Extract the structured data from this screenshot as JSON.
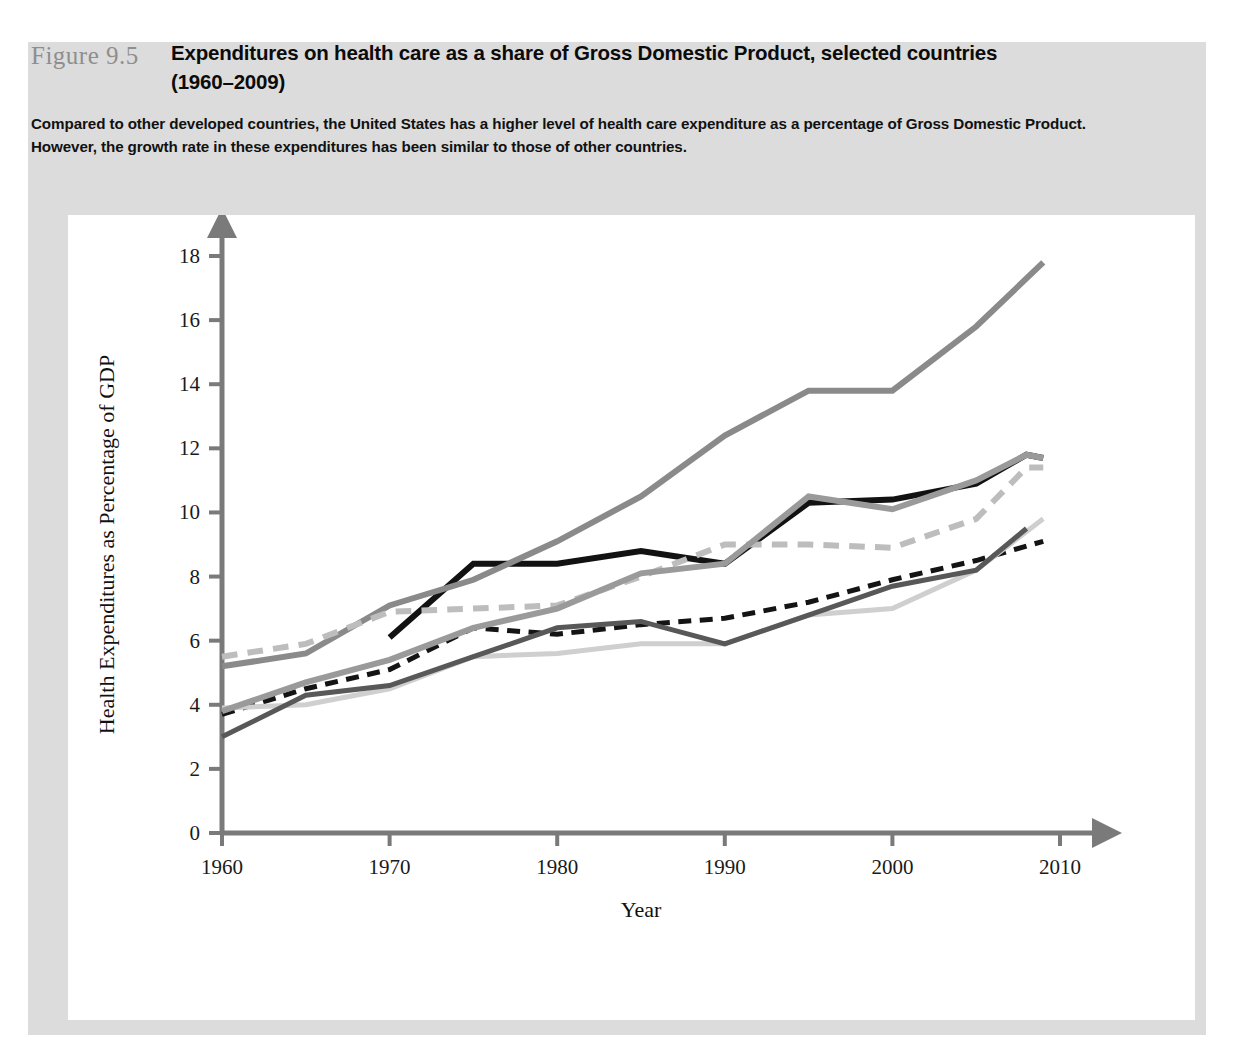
{
  "figure": {
    "number": "Figure 9.5",
    "title_line1": "Expenditures on health care as a share of Gross Domestic Product, selected countries",
    "title_line2": "(1960–2009)",
    "caption_line1": "Compared to other developed countries, the United States has a higher level of health care expenditure as a percentage of Gross Domestic Product.",
    "caption_line2": "However, the growth rate in these expenditures has been similar to those of other countries."
  },
  "colors": {
    "frame_background": "#dcdcdc",
    "panel_background": "#ffffff",
    "axis": "#7a7a7a",
    "text": "#111111",
    "figure_number": "#8e8e8e",
    "australia": "#141414",
    "united_kingdom": "#cfcfcf",
    "germany": "#121212",
    "united_states": "#8a8a8a",
    "japan": "#585858",
    "canada": "#bdbdbd",
    "france": "#9a9a9a"
  },
  "legend": {
    "rows": [
      [
        {
          "label": "Australia",
          "key": "australia",
          "color": "#141414",
          "dashed": true,
          "width": 7
        },
        {
          "label": "United Kingdom",
          "key": "united_kingdom",
          "color": "#cfcfcf",
          "dashed": false,
          "width": 5
        },
        {
          "label": "Germany",
          "key": "germany",
          "color": "#121212",
          "dashed": false,
          "width": 7
        },
        {
          "label": "United States",
          "key": "united_states",
          "color": "#8a8a8a",
          "dashed": false,
          "width": 7
        }
      ],
      [
        {
          "label": "Japan",
          "key": "japan",
          "color": "#585858",
          "dashed": false,
          "width": 7
        },
        {
          "label": "Canada",
          "key": "canada",
          "color": "#bdbdbd",
          "dashed": true,
          "width": 7
        },
        {
          "label": "France",
          "key": "france",
          "color": "#9a9a9a",
          "dashed": false,
          "width": 7
        }
      ]
    ]
  },
  "chart_data": {
    "type": "line",
    "title": "Expenditures on health care as a share of Gross Domestic Product, selected countries (1960–2009)",
    "xlabel": "Year",
    "ylabel": "Health Expenditures as Percentage of GDP",
    "xlim": [
      1960,
      2010
    ],
    "ylim": [
      0,
      18
    ],
    "xticks": [
      1960,
      1970,
      1980,
      1990,
      2000,
      2010
    ],
    "yticks": [
      0,
      2,
      4,
      6,
      8,
      10,
      12,
      14,
      16,
      18
    ],
    "grid": false,
    "legend_position": "bottom",
    "series": [
      {
        "name": "Australia",
        "color": "#141414",
        "style": "dashed",
        "width": 5,
        "x": [
          1960,
          1965,
          1970,
          1975,
          1980,
          1985,
          1990,
          1995,
          2000,
          2005,
          2009
        ],
        "values": [
          3.7,
          4.5,
          5.1,
          6.4,
          6.2,
          6.5,
          6.7,
          7.2,
          7.9,
          8.5,
          9.1
        ]
      },
      {
        "name": "United Kingdom",
        "color": "#cfcfcf",
        "style": "solid",
        "width": 5,
        "x": [
          1960,
          1965,
          1970,
          1975,
          1980,
          1985,
          1990,
          1995,
          2000,
          2005,
          2009
        ],
        "values": [
          3.9,
          4.0,
          4.5,
          5.5,
          5.6,
          5.9,
          5.9,
          6.8,
          7.0,
          8.2,
          9.8
        ]
      },
      {
        "name": "Germany",
        "color": "#121212",
        "style": "solid",
        "width": 6,
        "x": [
          1970,
          1975,
          1980,
          1985,
          1990,
          1995,
          2000,
          2005,
          2008,
          2009
        ],
        "values": [
          6.1,
          8.4,
          8.4,
          8.8,
          8.4,
          10.3,
          10.4,
          10.9,
          11.8,
          11.7
        ]
      },
      {
        "name": "United States",
        "color": "#8a8a8a",
        "style": "solid",
        "width": 6,
        "x": [
          1960,
          1965,
          1970,
          1975,
          1980,
          1985,
          1990,
          1995,
          2000,
          2005,
          2009
        ],
        "values": [
          5.2,
          5.6,
          7.1,
          7.9,
          9.1,
          10.5,
          12.4,
          13.8,
          13.8,
          15.8,
          17.8
        ]
      },
      {
        "name": "Japan",
        "color": "#585858",
        "style": "solid",
        "width": 5,
        "x": [
          1960,
          1965,
          1970,
          1975,
          1980,
          1985,
          1990,
          1995,
          2000,
          2005,
          2008
        ],
        "values": [
          3.0,
          4.3,
          4.6,
          5.5,
          6.4,
          6.6,
          5.9,
          6.8,
          7.7,
          8.2,
          9.5
        ]
      },
      {
        "name": "Canada",
        "color": "#bdbdbd",
        "style": "dashed",
        "width": 6,
        "x": [
          1960,
          1965,
          1970,
          1975,
          1980,
          1985,
          1990,
          1995,
          2000,
          2005,
          2008,
          2009
        ],
        "values": [
          5.5,
          5.9,
          6.9,
          7.0,
          7.1,
          8.0,
          9.0,
          9.0,
          8.9,
          9.8,
          11.4,
          11.4
        ]
      },
      {
        "name": "France",
        "color": "#9a9a9a",
        "style": "solid",
        "width": 6,
        "x": [
          1960,
          1965,
          1970,
          1975,
          1980,
          1985,
          1990,
          1995,
          2000,
          2005,
          2008,
          2009
        ],
        "values": [
          3.8,
          4.7,
          5.4,
          6.4,
          7.0,
          8.1,
          8.4,
          10.5,
          10.1,
          11.0,
          11.8,
          11.7
        ]
      }
    ]
  }
}
